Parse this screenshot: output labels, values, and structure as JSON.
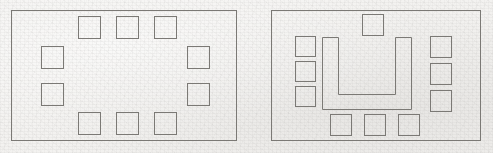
{
  "page": {
    "background_color": "#f2f1ef",
    "line_color": "#7b7975",
    "width": 493,
    "height": 153
  },
  "diagrams": [
    {
      "id": "hollow-square-layout",
      "name": "Hollow square / boardroom perimeter layout",
      "room": {
        "x": 11,
        "y": 10,
        "w": 226,
        "h": 131
      },
      "seat_count": 10,
      "table": null,
      "seats": [
        {
          "name": "seat-top-1",
          "x": 78,
          "y": 16,
          "w": 23,
          "h": 23
        },
        {
          "name": "seat-top-2",
          "x": 116,
          "y": 16,
          "w": 23,
          "h": 23
        },
        {
          "name": "seat-top-3",
          "x": 154,
          "y": 16,
          "w": 23,
          "h": 23
        },
        {
          "name": "seat-left-1",
          "x": 41,
          "y": 46,
          "w": 23,
          "h": 23
        },
        {
          "name": "seat-left-2",
          "x": 41,
          "y": 83,
          "w": 23,
          "h": 23
        },
        {
          "name": "seat-right-1",
          "x": 187,
          "y": 46,
          "w": 23,
          "h": 23
        },
        {
          "name": "seat-right-2",
          "x": 187,
          "y": 83,
          "w": 23,
          "h": 23
        },
        {
          "name": "seat-bottom-1",
          "x": 78,
          "y": 112,
          "w": 23,
          "h": 23
        },
        {
          "name": "seat-bottom-2",
          "x": 116,
          "y": 112,
          "w": 23,
          "h": 23
        },
        {
          "name": "seat-bottom-3",
          "x": 154,
          "y": 112,
          "w": 23,
          "h": 23
        }
      ]
    },
    {
      "id": "u-shape-layout",
      "name": "U-shape table layout",
      "room": {
        "x": 271,
        "y": 10,
        "w": 210,
        "h": 131
      },
      "seat_count": 10,
      "table": {
        "name": "u-shaped-table",
        "x": 322,
        "y": 37,
        "w": 89,
        "h": 72,
        "arm_width": 16,
        "outline_points": "0,0 0,72 89,72 89,0 73,0 73,57 16,57 16,0"
      },
      "seats": [
        {
          "name": "seat-top-1",
          "x": 362,
          "y": 14,
          "w": 22,
          "h": 22
        },
        {
          "name": "seat-left-1",
          "x": 295,
          "y": 36,
          "w": 21,
          "h": 21
        },
        {
          "name": "seat-left-2",
          "x": 295,
          "y": 61,
          "w": 21,
          "h": 21
        },
        {
          "name": "seat-left-3",
          "x": 295,
          "y": 86,
          "w": 21,
          "h": 21
        },
        {
          "name": "seat-right-1",
          "x": 430,
          "y": 36,
          "w": 22,
          "h": 22
        },
        {
          "name": "seat-right-2",
          "x": 430,
          "y": 63,
          "w": 22,
          "h": 22
        },
        {
          "name": "seat-right-3",
          "x": 430,
          "y": 90,
          "w": 22,
          "h": 22
        },
        {
          "name": "seat-bottom-1",
          "x": 330,
          "y": 114,
          "w": 22,
          "h": 22
        },
        {
          "name": "seat-bottom-2",
          "x": 364,
          "y": 114,
          "w": 22,
          "h": 22
        },
        {
          "name": "seat-bottom-3",
          "x": 398,
          "y": 114,
          "w": 22,
          "h": 22
        }
      ]
    }
  ]
}
